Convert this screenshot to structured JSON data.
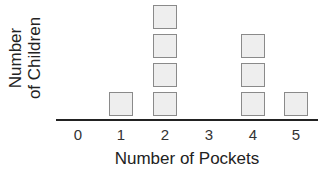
{
  "chart_data": {
    "type": "bar",
    "subtype": "pictograph",
    "title": "",
    "xlabel": "Number of Pockets",
    "ylabel": "Number of Children",
    "ylabel_lines": [
      "Number",
      "of Children"
    ],
    "categories": [
      "0",
      "1",
      "2",
      "3",
      "4",
      "5"
    ],
    "values": [
      0,
      1,
      4,
      0,
      3,
      1
    ],
    "ylim": [
      0,
      4
    ],
    "grid": false,
    "legend": null
  },
  "colors": {
    "square_fill": "#eeeeee",
    "square_border": "#8a8a8a",
    "axis": "#222222"
  }
}
